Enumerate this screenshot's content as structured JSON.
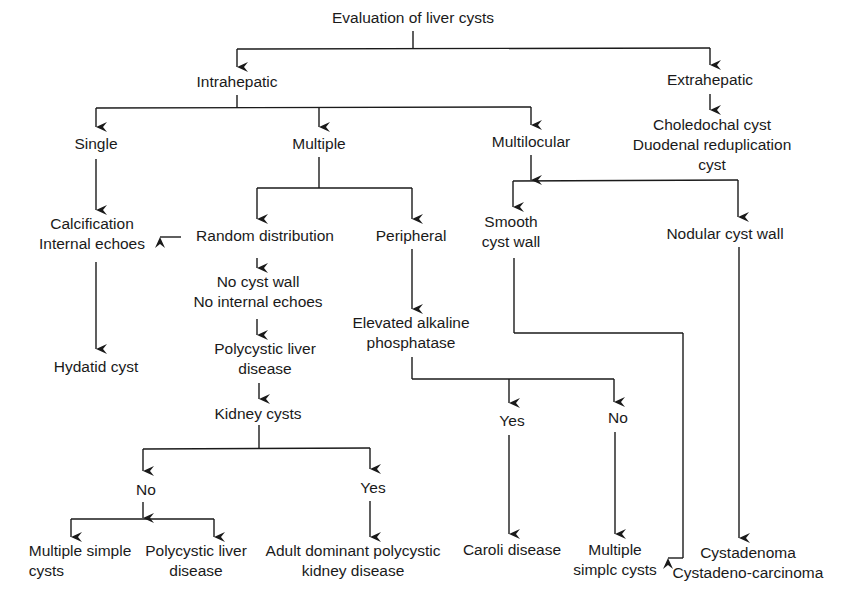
{
  "title": "Evaluation of liver cysts",
  "nodes": {
    "root": {
      "lines": [
        "Evaluation of liver cysts"
      ],
      "x": 413,
      "y": 8
    },
    "intrahepatic": {
      "lines": [
        "Intrahepatic"
      ],
      "x": 237,
      "y": 72
    },
    "extrahepatic": {
      "lines": [
        "Extrahepatic"
      ],
      "x": 710,
      "y": 70
    },
    "choledochal": {
      "lines": [
        "Choledochal cyst",
        "Duodenal reduplication",
        "cyst"
      ],
      "x": 712,
      "y": 115
    },
    "single": {
      "lines": [
        "Single"
      ],
      "x": 96,
      "y": 134
    },
    "multiple": {
      "lines": [
        "Multiple"
      ],
      "x": 319,
      "y": 134
    },
    "multilocular": {
      "lines": [
        "Multilocular"
      ],
      "x": 531,
      "y": 132
    },
    "calcification": {
      "lines": [
        "Calcification",
        "Internal echoes"
      ],
      "x": 92,
      "y": 214
    },
    "random": {
      "lines": [
        "Random distribution"
      ],
      "x": 265,
      "y": 225
    },
    "peripheral": {
      "lines": [
        "Peripheral"
      ],
      "x": 411,
      "y": 225
    },
    "smooth": {
      "lines": [
        "Smooth",
        "cyst wall"
      ],
      "x": 511,
      "y": 212
    },
    "nodular": {
      "lines": [
        "Nodular cyst wall"
      ],
      "x": 725,
      "y": 223
    },
    "no_cyst_wall": {
      "lines": [
        "No cyst wall",
        "No internal echoes"
      ],
      "x": 258,
      "y": 272
    },
    "elevated": {
      "lines": [
        "Elevated alkaline",
        "phosphatase"
      ],
      "x": 411,
      "y": 313
    },
    "hydatid": {
      "lines": [
        "Hydatid cyst"
      ],
      "x": 96,
      "y": 357
    },
    "pld_middle": {
      "lines": [
        "Polycystic liver",
        "disease"
      ],
      "x": 265,
      "y": 338
    },
    "kidney": {
      "lines": [
        "Kidney cysts"
      ],
      "x": 258,
      "y": 403
    },
    "yes_alk": {
      "lines": [
        "Yes"
      ],
      "x": 512,
      "y": 411
    },
    "no_alk": {
      "lines": [
        "No"
      ],
      "x": 618,
      "y": 408
    },
    "no_kid": {
      "lines": [
        "No"
      ],
      "x": 146,
      "y": 480
    },
    "yes_kid": {
      "lines": [
        "Yes"
      ],
      "x": 373,
      "y": 478
    },
    "multiple_simple_left": {
      "lines": [
        "Multiple simple",
        "cysts"
      ],
      "x": 80,
      "y": 541
    },
    "pld_left": {
      "lines": [
        "Polycystic liver",
        "disease"
      ],
      "x": 196,
      "y": 541
    },
    "adpkd": {
      "lines": [
        "Adult dominant polycystic",
        "kidney disease"
      ],
      "x": 353,
      "y": 541
    },
    "caroli": {
      "lines": [
        "Caroli disease"
      ],
      "x": 512,
      "y": 539
    },
    "multiple_simple_right": {
      "lines": [
        "Multiple",
        "simplc cysts"
      ],
      "x": 615,
      "y": 539
    },
    "cystadenoma": {
      "lines": [
        "Cystadenoma",
        "Cystadeno-carcinoma"
      ],
      "x": 748,
      "y": 542
    }
  },
  "colors": {
    "line": "#1a1a1a",
    "text": "#1a1a1a",
    "background": "#ffffff"
  }
}
